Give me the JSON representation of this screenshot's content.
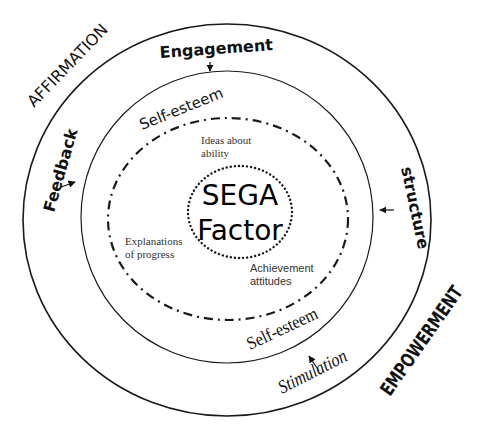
{
  "diagram": {
    "center": {
      "line1": "SEGA",
      "line2": "Factor"
    },
    "outer_labels": {
      "top_left": "AFFIRMATION",
      "bottom_right": "EMPOWERMENT"
    },
    "ring_labels": {
      "top": "Engagement",
      "left": "Feedback",
      "right": "structure",
      "bottom": "Stimulation"
    },
    "inner_ring_labels": {
      "top": "Self-esteem",
      "bottom": "Self-esteem"
    },
    "inner_notes": {
      "ideas": {
        "line1": "Ideas about",
        "line2": "ability"
      },
      "explanations": {
        "line1": "Explanations",
        "line2": "of progress"
      },
      "achievement": {
        "line1": "Achievement",
        "line2": "attitudes"
      }
    },
    "colors": {
      "stroke": "#1a1a1a",
      "text": "#111111",
      "background": "#ffffff"
    }
  }
}
